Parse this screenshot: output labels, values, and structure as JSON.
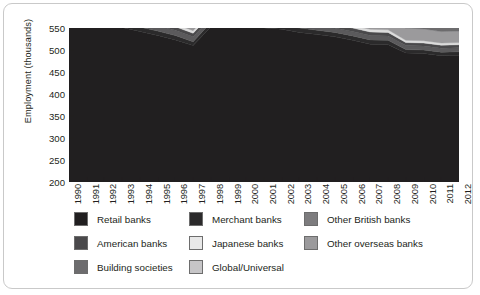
{
  "chart_data": {
    "type": "area",
    "stacked": true,
    "title": "",
    "xlabel": "",
    "ylabel": "Employment (thousands)",
    "ylim": [
      200,
      550
    ],
    "yticks": [
      200,
      250,
      300,
      350,
      400,
      450,
      500,
      550
    ],
    "grid": false,
    "legend_position": "bottom",
    "categories": [
      "1990",
      "1991",
      "1992",
      "1993",
      "1994",
      "1995",
      "1996",
      "1997",
      "1998",
      "1999",
      "2000",
      "2001",
      "2002",
      "2003",
      "2004",
      "2005",
      "2006",
      "2007",
      "2008",
      "2009",
      "2010",
      "2011",
      "2012"
    ],
    "series": [
      {
        "name": "Retail banks",
        "color": "#211f20",
        "values": [
          381,
          373,
          362,
          351,
          342,
          333,
          323,
          310,
          352,
          352,
          350,
          350,
          347,
          340,
          335,
          330,
          322,
          313,
          312,
          293,
          292,
          287,
          288
        ]
      },
      {
        "name": "Merchant banks",
        "color": "#2b2a2b",
        "values": [
          10,
          10,
          10,
          10,
          10,
          10,
          10,
          9,
          10,
          10,
          10,
          10,
          10,
          10,
          10,
          10,
          10,
          10,
          10,
          8,
          8,
          8,
          8
        ]
      },
      {
        "name": "Other British banks",
        "color": "#5b5a5c",
        "values": [
          13,
          13,
          13,
          13,
          12,
          12,
          12,
          11,
          10,
          10,
          10,
          10,
          10,
          10,
          10,
          10,
          10,
          10,
          10,
          9,
          9,
          9,
          9
        ]
      },
      {
        "name": "American banks",
        "color": "#4a494b",
        "values": [
          9,
          9,
          9,
          8,
          8,
          8,
          8,
          8,
          8,
          8,
          8,
          8,
          8,
          8,
          8,
          8,
          8,
          8,
          8,
          7,
          7,
          7,
          7
        ]
      },
      {
        "name": "Japanese banks",
        "color": "#dcdcdc",
        "values": [
          8,
          8,
          8,
          8,
          7,
          7,
          6,
          6,
          6,
          6,
          6,
          6,
          6,
          6,
          6,
          6,
          6,
          6,
          6,
          5,
          5,
          5,
          5
        ]
      },
      {
        "name": "Other overseas banks",
        "color": "#9b9a9c",
        "values": [
          22,
          22,
          22,
          22,
          22,
          22,
          21,
          21,
          24,
          25,
          26,
          26,
          26,
          27,
          28,
          29,
          30,
          31,
          31,
          28,
          27,
          26,
          26
        ]
      },
      {
        "name": "Building societies",
        "color": "#6d6c6e",
        "values": [
          76,
          74,
          72,
          70,
          69,
          68,
          66,
          65,
          34,
          34,
          34,
          34,
          34,
          34,
          34,
          34,
          34,
          34,
          34,
          33,
          32,
          32,
          31
        ]
      },
      {
        "name": "Global/Universal",
        "color": "#b9b8ba",
        "values": [
          0,
          0,
          0,
          0,
          0,
          0,
          0,
          0,
          44,
          45,
          46,
          47,
          48,
          50,
          52,
          55,
          58,
          60,
          58,
          50,
          46,
          44,
          42
        ]
      }
    ]
  },
  "legend": {
    "columns": [
      [
        {
          "label": "Retail banks",
          "color": "#211f20"
        },
        {
          "label": "American banks",
          "color": "#4a494b"
        },
        {
          "label": "Building societies",
          "color": "#6d6c6e"
        }
      ],
      [
        {
          "label": "Merchant banks",
          "color": "#2b2a2b"
        },
        {
          "label": "Japanese banks",
          "color": "#e8e8e8"
        },
        {
          "label": "Global/Universal",
          "color": "#c6c5c7"
        }
      ],
      [
        {
          "label": "Other British banks",
          "color": "#7d7c7e"
        },
        {
          "label": "Other overseas banks",
          "color": "#9b9a9c"
        }
      ]
    ]
  }
}
